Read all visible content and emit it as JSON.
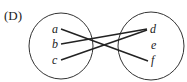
{
  "option_label": "(D)",
  "domain_set": {
    "elements": [
      "a",
      "b",
      "c"
    ]
  },
  "codomain_set": {
    "elements": [
      "d",
      "e",
      "f"
    ]
  },
  "mappings": [
    {
      "from": "a",
      "to": "f"
    },
    {
      "from": "b",
      "to": "d"
    },
    {
      "from": "c",
      "to": "d"
    }
  ]
}
